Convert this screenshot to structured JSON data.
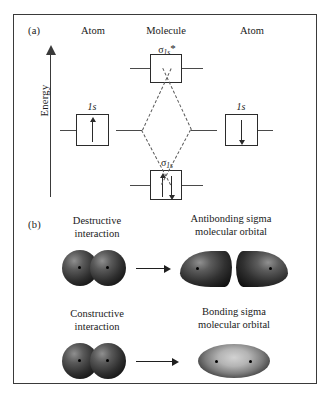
{
  "figure": {
    "panel_a": {
      "tag": "(a)",
      "axis_label": "Energy",
      "columns": [
        {
          "label": "Atom"
        },
        {
          "label": "Molecule"
        },
        {
          "label": "Atom"
        }
      ],
      "levels": [
        {
          "id": "antibonding",
          "label_sigma": "σ",
          "label_sub": "1s",
          "label_star": "*",
          "electrons": []
        },
        {
          "id": "bonding",
          "label_sigma": "σ",
          "label_sub": "1s",
          "label_star": "",
          "electrons": [
            "up",
            "down"
          ]
        },
        {
          "id": "atom-left-1s",
          "label": "1s",
          "electrons": [
            "up"
          ]
        },
        {
          "id": "atom-right-1s",
          "label": "1s",
          "electrons": [
            "down"
          ]
        }
      ]
    },
    "panel_b": {
      "tag": "(b)",
      "rows": [
        {
          "id": "destructive",
          "source_caption_line1": "Destructive",
          "source_caption_line2": "interaction",
          "result_caption_line1": "Antibonding sigma",
          "result_caption_line2": "molecular orbital"
        },
        {
          "id": "constructive",
          "source_caption_line1": "Constructive",
          "source_caption_line2": "interaction",
          "result_caption_line1": "Bonding sigma",
          "result_caption_line2": "molecular orbital"
        }
      ]
    }
  }
}
